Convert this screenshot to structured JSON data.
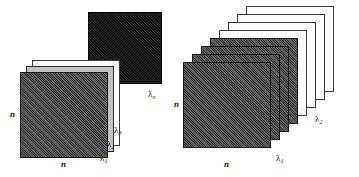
{
  "figure": {
    "title": "",
    "background_color": "#ffffff",
    "width": 359,
    "height": 177
  },
  "panels": [
    {
      "id": "left",
      "name": "sparse-band-stack",
      "plates": [
        {
          "id": "ln",
          "style": "black",
          "label": "λ",
          "sub": "n",
          "x": 88,
          "y": 12,
          "w": 74,
          "h": 72
        },
        {
          "id": "l3",
          "style": "white",
          "label": "λ",
          "sub": "3",
          "x": 32,
          "y": 60,
          "w": 88,
          "h": 86
        },
        {
          "id": "l2",
          "style": "grey",
          "label": "λ",
          "sub": "2",
          "x": 26,
          "y": 66,
          "w": 88,
          "h": 86
        },
        {
          "id": "l1",
          "style": "dark",
          "label": "λ",
          "sub": "1",
          "x": 20,
          "y": 72,
          "w": 88,
          "h": 86
        }
      ],
      "axis_labels": {
        "vertical": "n",
        "horizontal": "n"
      },
      "band_labels": [
        {
          "text": "λ",
          "sub": "n",
          "x": 148,
          "y": 90
        },
        {
          "text": "λ",
          "sub": "3",
          "x": 114,
          "y": 126
        },
        {
          "text": "λ",
          "sub": "2",
          "x": 107,
          "y": 140
        },
        {
          "text": "λ",
          "sub": "1",
          "x": 100,
          "y": 154
        }
      ]
    },
    {
      "id": "right",
      "name": "dense-band-stack",
      "plates": [
        {
          "id": "r8",
          "style": "white",
          "x": 66,
          "y": 6,
          "w": 88,
          "h": 86
        },
        {
          "id": "r7",
          "style": "white",
          "x": 57,
          "y": 14,
          "w": 88,
          "h": 86
        },
        {
          "id": "r6",
          "style": "white",
          "x": 48,
          "y": 22,
          "w": 88,
          "h": 86
        },
        {
          "id": "r5",
          "style": "white",
          "x": 39,
          "y": 30,
          "w": 88,
          "h": 86
        },
        {
          "id": "r4",
          "style": "dark",
          "x": 30,
          "y": 38,
          "w": 88,
          "h": 86
        },
        {
          "id": "r3",
          "style": "dark",
          "x": 21,
          "y": 46,
          "w": 88,
          "h": 86
        },
        {
          "id": "r2",
          "style": "dark",
          "x": 12,
          "y": 54,
          "w": 88,
          "h": 86
        },
        {
          "id": "r1",
          "style": "dark",
          "x": 3,
          "y": 62,
          "w": 88,
          "h": 86
        }
      ],
      "axis_labels": {
        "vertical": "n",
        "horizontal": "n"
      },
      "band_labels": [
        {
          "text": "λ",
          "sub": "2",
          "x": 135,
          "y": 115
        },
        {
          "text": "λ",
          "sub": "1",
          "x": 96,
          "y": 154
        }
      ]
    }
  ],
  "colors": {
    "dark_plate": "#4a4a4a",
    "grey_plate": "#c2c2c2",
    "white_plate": "#fbfbfb",
    "black_plate": "#1b1b1b",
    "outline": "#1a1a1a",
    "text": "#111111"
  }
}
